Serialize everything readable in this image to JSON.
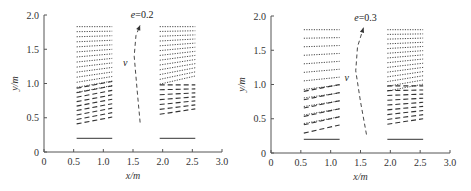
{
  "chart_data": [
    {
      "type": "line",
      "panel": "left",
      "title": "",
      "annotation": "e=0.2",
      "velocity_label": "v",
      "xlabel": "x/m",
      "ylabel": "y/m",
      "xlim": [
        0,
        3.0
      ],
      "ylim": [
        0,
        2.0
      ],
      "xticks": [
        "0",
        "0.5",
        "1.0",
        "1.5",
        "2.0",
        "2.5",
        "3.0"
      ],
      "yticks": [
        "0",
        "0.5",
        "1.0",
        "1.5",
        "2.0"
      ],
      "grid": false,
      "groups": [
        {
          "name": "left-array",
          "x_range": [
            0.55,
            1.15
          ],
          "solid_y": 0.2,
          "dotted": {
            "y_start_top": 1.83,
            "count": 14,
            "spacing": 0.07,
            "slope_top": 0.0,
            "slope_bottom": 0.1
          },
          "dashed": {
            "y_start_top": 0.98,
            "count": 9,
            "spacing": 0.065,
            "slope_top": 0.1,
            "slope_bottom": 0.1
          }
        },
        {
          "name": "right-array",
          "x_range": [
            1.95,
            2.55
          ],
          "solid_y": 0.2,
          "dotted": {
            "y_start_top": 1.83,
            "count": 13,
            "spacing": 0.065,
            "slope_top": 0.0,
            "slope_bottom": 0.12
          },
          "dashed": {
            "y_start_top": 0.98,
            "count": 7,
            "spacing": 0.065,
            "slope_top": 0.0,
            "slope_bottom": 0.08
          }
        }
      ],
      "arrow": {
        "points": [
          [
            1.62,
            0.43
          ],
          [
            1.57,
            0.9
          ],
          [
            1.52,
            1.4
          ],
          [
            1.55,
            1.7
          ],
          [
            1.62,
            1.85
          ]
        ]
      }
    },
    {
      "type": "line",
      "panel": "right",
      "title": "",
      "annotation": "e=0.3",
      "velocity_label": "v",
      "xlabel": "x/m",
      "ylabel": "y/m",
      "xlim": [
        0,
        3.0
      ],
      "ylim": [
        0,
        2.0
      ],
      "xticks": [
        "0",
        "0.5",
        "1.0",
        "1.5",
        "2.0",
        "2.5",
        "3.0"
      ],
      "yticks": [
        "0",
        "0.5",
        "1.0",
        "1.5",
        "2.0"
      ],
      "grid": false,
      "groups": [
        {
          "name": "left-array",
          "x_range": [
            0.55,
            1.15
          ],
          "solid_y": 0.2,
          "dotted": {
            "y_start_top": 1.8,
            "count": 12,
            "spacing": 0.12,
            "slope_top": 0.0,
            "slope_bottom": 0.1
          },
          "dashed": {
            "y_start_top": 0.95,
            "count": 6,
            "spacing": 0.12,
            "slope_top": 0.1,
            "slope_bottom": 0.12
          }
        },
        {
          "name": "right-array",
          "x_range": [
            1.95,
            2.55
          ],
          "solid_y": 0.2,
          "dotted": {
            "y_start_top": 1.8,
            "count": 14,
            "spacing": 0.065,
            "slope_top": 0.0,
            "slope_bottom": 0.1
          },
          "dashed": {
            "y_start_top": 0.98,
            "count": 9,
            "spacing": 0.065,
            "slope_top": 0.0,
            "slope_bottom": 0.08
          }
        }
      ],
      "arrow": {
        "points": [
          [
            1.6,
            0.27
          ],
          [
            1.5,
            0.75
          ],
          [
            1.42,
            1.2
          ],
          [
            1.45,
            1.55
          ],
          [
            1.55,
            1.83
          ]
        ]
      }
    }
  ],
  "panels": [
    {
      "id": "left",
      "origin_px": [
        44,
        152
      ],
      "width_px": 178,
      "height_px": 137
    },
    {
      "id": "right",
      "origin_px": [
        271,
        153
      ],
      "width_px": 179,
      "height_px": 137
    }
  ],
  "colors": {
    "axis": "#555555",
    "lines": "#333333",
    "text": "#333333"
  }
}
